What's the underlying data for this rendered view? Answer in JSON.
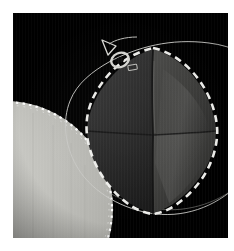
{
  "viewer": {
    "title": "Segmentation Overlay",
    "canvas": {
      "width": 215,
      "height": 225,
      "background_color": "#000000"
    },
    "page_background_color": "#ffffff"
  },
  "colors": {
    "background": "#000000",
    "page_margin": "#ffffff",
    "contour_line": "#c8c8c4",
    "segmentation_dash": "#f2f2ee",
    "octahedron_dark_face": "#2a2a2a",
    "octahedron_mid_face": "#3a3a3a",
    "octahedron_light_face": "#4e4e4c",
    "octahedron_edge": "#141414",
    "sphere_fill": "#b9b9b4",
    "sphere_highlight": "#d2d2cd",
    "sphere_dash": "#ffffff",
    "marker_stroke": "#d8d8d4"
  },
  "objects": {
    "octahedron": {
      "label": "segmented-octahedron",
      "center_x": 138,
      "center_y": 118,
      "radius_x": 66,
      "radius_y": 85,
      "outline_style": "dashed",
      "outline_color": "#f2f2ee",
      "dash_pattern": "7 5"
    },
    "roi_contour": {
      "label": "roi-contour",
      "style": "solid-thin",
      "color": "#c8c8c4",
      "stroke_width": 1
    },
    "sphere": {
      "label": "bright-sphere",
      "center_x": -8,
      "center_y": 196,
      "radius": 108,
      "outline_style": "dotted",
      "outline_color": "#ffffff"
    },
    "marker": {
      "label": "orientation-marker",
      "x": 88,
      "y": 30,
      "glyph": "arrow-with-loop"
    }
  },
  "chart_data": {
    "type": "scatter",
    "xlabel": "",
    "ylabel": "",
    "annotations": [
      "roi-contour",
      "segmented-octahedron",
      "bright-sphere",
      "orientation-marker"
    ]
  }
}
